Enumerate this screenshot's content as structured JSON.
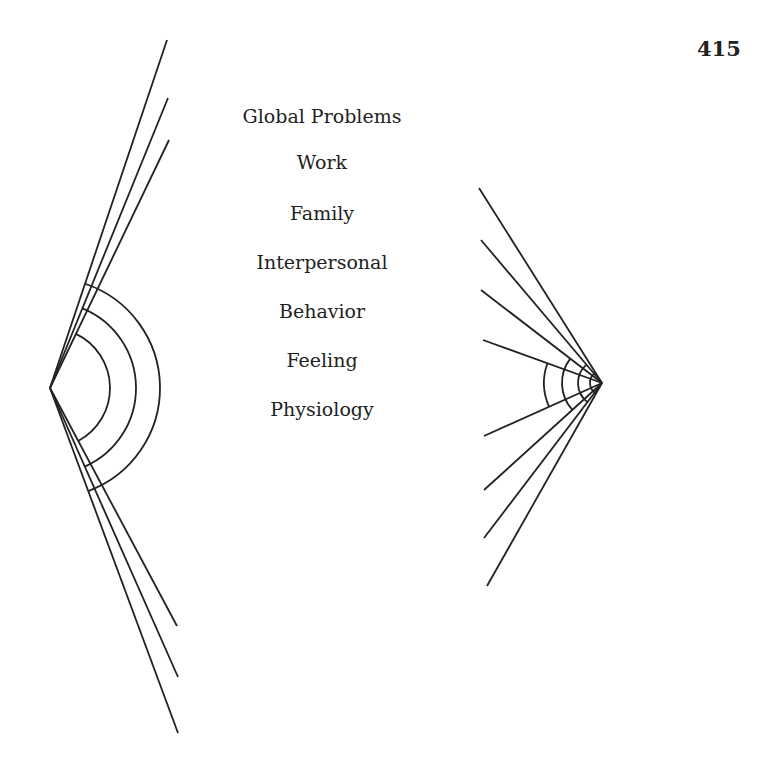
{
  "page_number": "415",
  "labels": [
    "Global Problems",
    "Work",
    "Family",
    "Interpersonal",
    "Behavior",
    "Feeling",
    "Physiology"
  ],
  "label_y": [
    105,
    151,
    202,
    251,
    300,
    349,
    398
  ],
  "left_figure": {
    "vertex": [
      50,
      388
    ],
    "upper_line_ends": [
      [
        167,
        40
      ],
      [
        168,
        98
      ],
      [
        169,
        140
      ]
    ],
    "lower_line_ends": [
      [
        177,
        626
      ],
      [
        178,
        677
      ],
      [
        178,
        733
      ]
    ],
    "arc_radii": [
      60,
      86,
      110
    ]
  },
  "right_figure": {
    "vertex": [
      602,
      383
    ],
    "line_ends": [
      [
        479,
        188
      ],
      [
        481,
        240
      ],
      [
        481,
        290
      ],
      [
        483,
        340
      ],
      [
        484,
        436
      ],
      [
        484,
        490
      ],
      [
        484,
        538
      ],
      [
        487,
        586
      ]
    ],
    "arc_radii": [
      12,
      24,
      40,
      58
    ]
  },
  "colors": {
    "ink": "#222222",
    "background": "#ffffff"
  }
}
